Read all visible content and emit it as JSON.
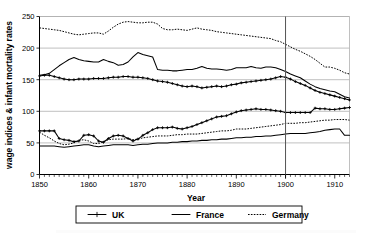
{
  "figure": {
    "background": "#ffffff",
    "ink": "#000000",
    "grid_color": "#b0b0b0"
  },
  "axes": {
    "y_title": "wage indices & infant mortality rates",
    "x_title": "Year",
    "y_ticks": [
      0,
      50,
      100,
      150,
      200,
      250
    ],
    "x_ticks": [
      1850,
      1860,
      1870,
      1880,
      1890,
      1900,
      1910
    ]
  },
  "legend": {
    "items": [
      {
        "label": "UK",
        "style": "line-with-plus-markers"
      },
      {
        "label": "France",
        "style": "solid-line"
      },
      {
        "label": "Germany",
        "style": "dotted-line"
      }
    ]
  },
  "annotations": {
    "reference_year": 1900
  },
  "chart_data": {
    "type": "line",
    "title": "",
    "subtitle": "",
    "xlabel": "Year",
    "ylabel": "wage indices & infant mortality rates",
    "xlim": [
      1850,
      1913
    ],
    "ylim": [
      0,
      250
    ],
    "xticks": [
      1850,
      1860,
      1870,
      1880,
      1890,
      1900,
      1910
    ],
    "yticks": [
      0,
      50,
      100,
      150,
      200,
      250
    ],
    "grid": "horizontal",
    "legend_position": "below-axes",
    "annotations": [
      {
        "type": "vline",
        "x": 1900,
        "label": ""
      }
    ],
    "legend_entries": [
      "UK",
      "France",
      "Germany"
    ],
    "x": [
      1850,
      1851,
      1852,
      1853,
      1854,
      1855,
      1856,
      1857,
      1858,
      1859,
      1860,
      1861,
      1862,
      1863,
      1864,
      1865,
      1866,
      1867,
      1868,
      1869,
      1870,
      1871,
      1872,
      1873,
      1874,
      1875,
      1876,
      1877,
      1878,
      1879,
      1880,
      1881,
      1882,
      1883,
      1884,
      1885,
      1886,
      1887,
      1888,
      1889,
      1890,
      1891,
      1892,
      1893,
      1894,
      1895,
      1896,
      1897,
      1898,
      1899,
      1900,
      1901,
      1902,
      1903,
      1904,
      1905,
      1906,
      1907,
      1908,
      1909,
      1910,
      1911,
      1912,
      1913
    ],
    "series": [
      {
        "name": "Germany infant mortality",
        "country": "Germany",
        "measure": "infant mortality rate",
        "style": "dotted",
        "group": "upper",
        "values": [
          232,
          231,
          230,
          229,
          228,
          226,
          224,
          222,
          221,
          222,
          223,
          224,
          224,
          222,
          227,
          233,
          238,
          241,
          242,
          241,
          240,
          240,
          241,
          241,
          238,
          231,
          229,
          229,
          230,
          229,
          228,
          230,
          232,
          230,
          229,
          228,
          226,
          225,
          224,
          223,
          222,
          221,
          220,
          219,
          218,
          217,
          216,
          215,
          212,
          210,
          206,
          202,
          198,
          195,
          191,
          187,
          182,
          176,
          170,
          170,
          168,
          165,
          161,
          159
        ]
      },
      {
        "name": "France infant mortality",
        "country": "France",
        "measure": "infant mortality rate",
        "style": "solid",
        "group": "upper",
        "values": [
          157,
          158,
          160,
          166,
          172,
          177,
          182,
          185,
          182,
          180,
          179,
          178,
          178,
          182,
          179,
          177,
          173,
          174,
          178,
          186,
          193,
          190,
          188,
          186,
          166,
          165,
          165,
          164,
          164,
          165,
          166,
          166,
          168,
          171,
          168,
          167,
          167,
          166,
          165,
          166,
          169,
          169,
          169,
          171,
          169,
          168,
          170,
          170,
          169,
          166,
          163,
          159,
          156,
          153,
          148,
          143,
          139,
          136,
          134,
          132,
          131,
          127,
          123,
          121
        ]
      },
      {
        "name": "UK infant mortality",
        "country": "UK",
        "measure": "infant mortality rate",
        "style": "marked",
        "group": "upper",
        "values": [
          156,
          157,
          157,
          155,
          153,
          151,
          150,
          150,
          151,
          151,
          151,
          152,
          152,
          152,
          153,
          154,
          154,
          155,
          155,
          154,
          154,
          153,
          152,
          150,
          148,
          147,
          146,
          144,
          142,
          140,
          139,
          140,
          139,
          137,
          138,
          139,
          140,
          139,
          140,
          142,
          143,
          145,
          146,
          147,
          148,
          149,
          150,
          151,
          153,
          155,
          154,
          151,
          147,
          144,
          141,
          137,
          133,
          130,
          128,
          126,
          124,
          122,
          120,
          118
        ]
      },
      {
        "name": "UK wage index",
        "country": "UK",
        "measure": "wage index",
        "style": "marked",
        "group": "lower",
        "values": [
          69,
          69,
          69,
          69,
          57,
          55,
          54,
          52,
          53,
          62,
          63,
          61,
          53,
          51,
          57,
          61,
          62,
          61,
          57,
          53,
          56,
          62,
          66,
          71,
          74,
          74,
          74,
          75,
          73,
          72,
          74,
          76,
          79,
          82,
          85,
          88,
          91,
          92,
          93,
          96,
          99,
          101,
          102,
          103,
          104,
          103,
          103,
          102,
          101,
          100,
          98,
          98,
          98,
          98,
          98,
          98,
          105,
          104,
          104,
          103,
          103,
          104,
          105,
          106
        ]
      },
      {
        "name": "Germany wage index",
        "country": "Germany",
        "measure": "wage index",
        "style": "dotted",
        "group": "lower",
        "values": [
          67,
          62,
          58,
          53,
          49,
          47,
          48,
          50,
          54,
          55,
          53,
          49,
          49,
          52,
          55,
          56,
          56,
          56,
          57,
          55,
          56,
          58,
          59,
          60,
          61,
          61,
          61,
          62,
          63,
          63,
          64,
          64,
          64,
          65,
          66,
          67,
          68,
          69,
          69,
          70,
          72,
          72,
          72,
          73,
          74,
          75,
          76,
          77,
          78,
          79,
          81,
          81,
          81,
          82,
          82,
          83,
          84,
          85,
          86,
          86,
          87,
          87,
          87,
          86
        ]
      },
      {
        "name": "France wage index",
        "country": "France",
        "measure": "wage index",
        "style": "solid",
        "group": "lower",
        "values": [
          45,
          45,
          45,
          45,
          44,
          43,
          44,
          45,
          46,
          47,
          47,
          45,
          44,
          45,
          46,
          47,
          47,
          47,
          47,
          46,
          47,
          48,
          48,
          49,
          50,
          50,
          50,
          51,
          51,
          52,
          52,
          53,
          53,
          54,
          54,
          55,
          55,
          56,
          56,
          57,
          58,
          58,
          59,
          59,
          60,
          60,
          61,
          61,
          62,
          63,
          64,
          65,
          65,
          65,
          65,
          66,
          67,
          68,
          70,
          71,
          72,
          72,
          62,
          62
        ]
      }
    ]
  }
}
